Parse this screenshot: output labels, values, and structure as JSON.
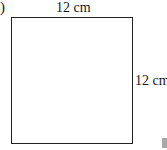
{
  "figure": {
    "label_fragment": ")",
    "shape": "square",
    "top_side": {
      "value": "12",
      "unit": "cm",
      "text": "12 cm"
    },
    "right_side": {
      "value": "12",
      "unit": "cm",
      "text": "12 cm"
    },
    "colors": {
      "stroke": "#222222",
      "fill": "#ffffff",
      "corner_mark": "#a8a8a8"
    }
  }
}
